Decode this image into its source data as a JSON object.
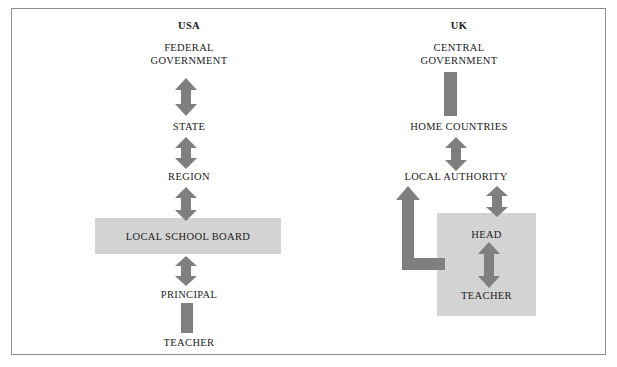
{
  "diagram": {
    "title_usa": "USA",
    "title_uk": "UK",
    "frame_color": "#8c8c92",
    "arrow_color": "#7f7f7f",
    "box_fill": "#d3d3d3",
    "text_color": "#1b1b1b",
    "background": "#ffffff"
  },
  "usa": {
    "heading": "USA",
    "nodes": [
      {
        "id": "federal-government",
        "label": "FEDERAL\nGOVERNMENT"
      },
      {
        "id": "state",
        "label": "STATE"
      },
      {
        "id": "region",
        "label": "REGION"
      },
      {
        "id": "local-school-board",
        "label": "LOCAL SCHOOL BOARD"
      },
      {
        "id": "principal",
        "label": "PRINCIPAL"
      },
      {
        "id": "teacher",
        "label": "TEACHER"
      }
    ],
    "connectors": [
      {
        "id": "federal-to-state",
        "from": "federal-government",
        "to": "state",
        "style": "double-arrow"
      },
      {
        "id": "state-to-region",
        "from": "state",
        "to": "region",
        "style": "double-arrow"
      },
      {
        "id": "region-to-local-school-board",
        "from": "region",
        "to": "local-school-board",
        "style": "double-arrow"
      },
      {
        "id": "local-school-board-to-principal",
        "from": "local-school-board",
        "to": "principal",
        "style": "double-arrow"
      },
      {
        "id": "principal-to-teacher",
        "from": "principal",
        "to": "teacher",
        "style": "plain-bar"
      }
    ]
  },
  "uk": {
    "heading": "UK",
    "nodes": [
      {
        "id": "central-government",
        "label": "CENTRAL\nGOVERNMENT"
      },
      {
        "id": "home-countries",
        "label": "HOME COUNTRIES"
      },
      {
        "id": "local-authority",
        "label": "LOCAL AUTHORITY"
      },
      {
        "id": "head",
        "label": "HEAD"
      },
      {
        "id": "teacher",
        "label": "TEACHER"
      }
    ],
    "connectors": [
      {
        "id": "central-to-home-countries",
        "from": "central-government",
        "to": "home-countries",
        "style": "plain-bar"
      },
      {
        "id": "home-countries-to-local-authority",
        "from": "home-countries",
        "to": "local-authority",
        "style": "double-arrow"
      },
      {
        "id": "local-authority-to-head",
        "from": "local-authority",
        "to": "head",
        "style": "double-arrow"
      },
      {
        "id": "head-to-teacher",
        "from": "head",
        "to": "teacher",
        "style": "double-arrow"
      },
      {
        "id": "school-to-local-authority-elbow",
        "from": "school-box",
        "to": "local-authority",
        "style": "elbow-arrow-up"
      }
    ]
  }
}
